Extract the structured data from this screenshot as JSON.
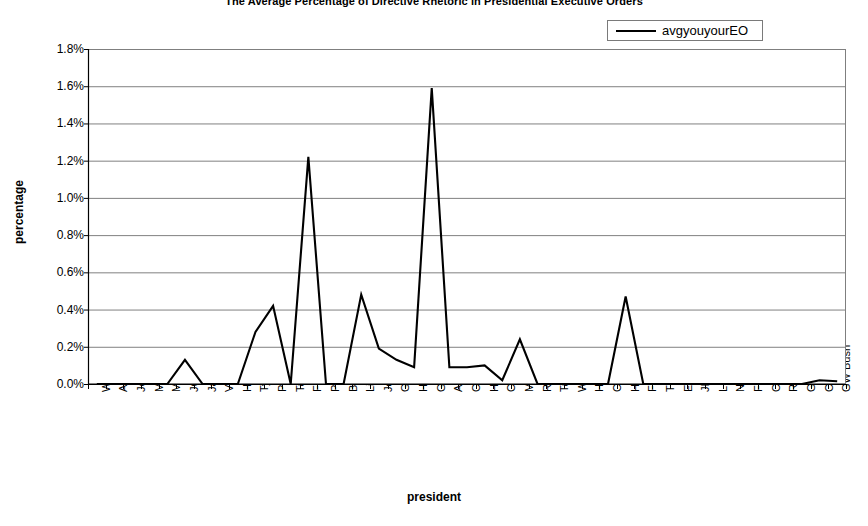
{
  "title": "The Average Percentage of Directive Rhetoric in Presidential Executive Orders",
  "axis": {
    "ylabel": "percentage",
    "xlabel": "president"
  },
  "legend": {
    "series_label": "avgyouyourEO",
    "line_color": "#000000"
  },
  "colors": {
    "line": "#000000",
    "gridline": "#808080",
    "frame": "#7f7f7f",
    "background": "#ffffff"
  },
  "chart_data": {
    "type": "line",
    "title": "The Average Percentage of Directive Rhetoric in Presidential Executive Orders",
    "xlabel": "president",
    "ylabel": "percentage",
    "ylim": [
      0,
      1.8
    ],
    "ytick_labels": [
      "1.8%",
      "1.6%",
      "1.4%",
      "1.2%",
      "1.0%",
      "0.8%",
      "0.6%",
      "0.4%",
      "0.2%",
      "0.0%"
    ],
    "ytick_values": [
      1.8,
      1.6,
      1.4,
      1.2,
      1.0,
      0.8,
      0.6,
      0.4,
      0.2,
      0.0
    ],
    "grid": true,
    "legend_position": "top-right",
    "units": "percent",
    "categories": [
      "Washington",
      "Adams",
      "Jefferson",
      "Madison",
      "Monroe",
      "JQ Adams",
      "Jackson",
      "VanBuren",
      "Harrison",
      "Tyler",
      "Polk",
      "Taylor",
      "Fillmore",
      "Pierce",
      "Bucnanan",
      "Lincoln",
      "Johnson",
      "Grant",
      "Hayes",
      "Garfield",
      "Arthur",
      "Cleveland1",
      "Harrison",
      "Cleveland2",
      "McKinley",
      "Roosevelt",
      "Taft",
      "Wilson",
      "Harding",
      "Coolidge",
      "Hoover",
      "FDR",
      "Truman",
      "Eisenhower",
      "JFK",
      "LBJ",
      "Nixon",
      "Ford",
      "Carter",
      "Reagan",
      "GHW Bush",
      "Clinton",
      "GW Bush"
    ],
    "series": [
      {
        "name": "avgyouyourEO",
        "values": [
          0.0,
          0.0,
          0.0,
          0.0,
          0.0,
          0.13,
          0.0,
          0.0,
          0.0,
          0.28,
          0.42,
          0.0,
          1.22,
          0.0,
          0.0,
          0.48,
          0.19,
          0.13,
          0.09,
          1.59,
          0.09,
          0.09,
          0.1,
          0.02,
          0.24,
          0.0,
          0.0,
          0.0,
          0.0,
          0.0,
          0.47,
          0.0,
          0.0,
          0.0,
          0.0,
          0.0,
          0.0,
          0.0,
          0.0,
          0.0,
          0.0,
          0.02,
          0.015
        ]
      }
    ]
  }
}
